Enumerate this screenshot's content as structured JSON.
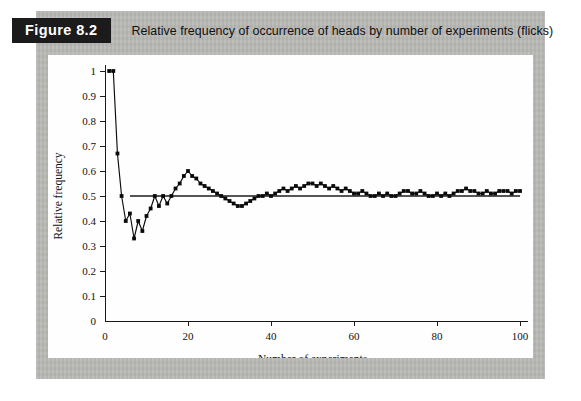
{
  "figure": {
    "tag": "Figure 8.2",
    "caption": "Relative frequency of occurrence of heads by number of experiments (flicks)"
  },
  "colors": {
    "mat": "#b9b9b6",
    "panel": "#fefefe",
    "tag_background": "#1b1b1b",
    "tag_text": "#ffffff",
    "data": "#0b0b0b",
    "reference_line": "#555555",
    "axis": "#1a1a1a"
  },
  "chart_data": {
    "type": "line",
    "title": "Relative frequency of occurrence of heads by number of experiments (flicks)",
    "xlabel": "Number of experiments",
    "ylabel": "Relative frequency",
    "xlim": [
      0,
      100
    ],
    "ylim": [
      0,
      1
    ],
    "xticks": [
      0,
      20,
      40,
      60,
      80,
      100
    ],
    "xtick_labels": [
      "0",
      "20",
      "40",
      "60",
      "80",
      "100"
    ],
    "yticks": [
      0,
      0.1,
      0.2,
      0.3,
      0.4,
      0.5,
      0.6,
      0.7,
      0.8,
      0.9,
      1
    ],
    "ytick_labels": [
      "0",
      "0.1",
      "0.2",
      "0.3",
      "0.4",
      "0.5",
      "0.6",
      "0.7",
      "0.8",
      "0.9",
      "1"
    ],
    "grid": false,
    "legend": "none",
    "markers": "filled-square",
    "reference_line": {
      "orientation": "horizontal",
      "value": 0.5,
      "x_start": 6,
      "x_end": 100
    },
    "x": [
      1,
      2,
      3,
      4,
      5,
      6,
      7,
      8,
      9,
      10,
      11,
      12,
      13,
      14,
      15,
      16,
      17,
      18,
      19,
      20,
      21,
      22,
      23,
      24,
      25,
      26,
      27,
      28,
      29,
      30,
      31,
      32,
      33,
      34,
      35,
      36,
      37,
      38,
      39,
      40,
      41,
      42,
      43,
      44,
      45,
      46,
      47,
      48,
      49,
      50,
      51,
      52,
      53,
      54,
      55,
      56,
      57,
      58,
      59,
      60,
      61,
      62,
      63,
      64,
      65,
      66,
      67,
      68,
      69,
      70,
      71,
      72,
      73,
      74,
      75,
      76,
      77,
      78,
      79,
      80,
      81,
      82,
      83,
      84,
      85,
      86,
      87,
      88,
      89,
      90,
      91,
      92,
      93,
      94,
      95,
      96,
      97,
      98,
      99,
      100
    ],
    "values": [
      1.0,
      1.0,
      0.67,
      0.5,
      0.4,
      0.43,
      0.33,
      0.4,
      0.36,
      0.42,
      0.45,
      0.5,
      0.46,
      0.5,
      0.47,
      0.5,
      0.53,
      0.55,
      0.58,
      0.6,
      0.58,
      0.57,
      0.55,
      0.54,
      0.53,
      0.52,
      0.51,
      0.5,
      0.49,
      0.48,
      0.47,
      0.46,
      0.46,
      0.47,
      0.48,
      0.49,
      0.5,
      0.5,
      0.51,
      0.5,
      0.51,
      0.52,
      0.53,
      0.52,
      0.53,
      0.54,
      0.53,
      0.54,
      0.55,
      0.55,
      0.54,
      0.55,
      0.54,
      0.53,
      0.54,
      0.53,
      0.52,
      0.53,
      0.52,
      0.51,
      0.51,
      0.52,
      0.51,
      0.5,
      0.5,
      0.51,
      0.5,
      0.51,
      0.5,
      0.5,
      0.51,
      0.52,
      0.52,
      0.51,
      0.51,
      0.52,
      0.51,
      0.5,
      0.5,
      0.51,
      0.5,
      0.51,
      0.5,
      0.51,
      0.52,
      0.52,
      0.53,
      0.52,
      0.52,
      0.51,
      0.51,
      0.52,
      0.51,
      0.51,
      0.52,
      0.52,
      0.52,
      0.51,
      0.52,
      0.52
    ]
  }
}
